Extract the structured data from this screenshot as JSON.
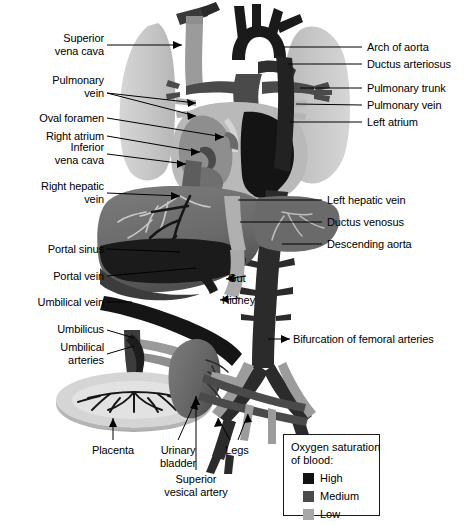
{
  "figure": {
    "type": "anatomical-diagram"
  },
  "labels_left": [
    {
      "id": "superior-vena-cava",
      "text": "Superior\nvena cava",
      "x": 18,
      "y": 32,
      "w": 86
    },
    {
      "id": "pulmonary-vein-left",
      "text": "Pulmonary\nvein",
      "x": 18,
      "y": 74,
      "w": 86
    },
    {
      "id": "oval-foramen",
      "text": "Oval foramen",
      "x": 14,
      "y": 112,
      "w": 90
    },
    {
      "id": "right-atrium",
      "text": "Right atrium",
      "x": 14,
      "y": 130,
      "w": 90
    },
    {
      "id": "inferior-vena-cava",
      "text": "Inferior\nvena cava",
      "x": 18,
      "y": 141,
      "w": 86
    },
    {
      "id": "right-hepatic-vein",
      "text": "Right hepatic\nvein",
      "x": 6,
      "y": 180,
      "w": 98
    },
    {
      "id": "portal-sinus",
      "text": "Portal sinus",
      "x": 14,
      "y": 243,
      "w": 90
    },
    {
      "id": "portal-vein",
      "text": "Portal vein",
      "x": 14,
      "y": 270,
      "w": 90
    },
    {
      "id": "umbilical-vein",
      "text": "Umbilical vein",
      "x": 6,
      "y": 296,
      "w": 98
    },
    {
      "id": "umbilicus",
      "text": "Umbilicus",
      "x": 22,
      "y": 323,
      "w": 82
    },
    {
      "id": "umbilical-arteries",
      "text": "Umbilical\narteries",
      "x": 26,
      "y": 341,
      "w": 78
    }
  ],
  "labels_right": [
    {
      "id": "arch-of-aorta",
      "text": "Arch of aorta",
      "x": 367,
      "y": 41
    },
    {
      "id": "ductus-arteriosus",
      "text": "Ductus arteriosus",
      "x": 367,
      "y": 58
    },
    {
      "id": "pulmonary-trunk",
      "text": "Pulmonary trunk",
      "x": 367,
      "y": 82
    },
    {
      "id": "pulmonary-vein-right",
      "text": "Pulmonary vein",
      "x": 367,
      "y": 99
    },
    {
      "id": "left-atrium",
      "text": "Left atrium",
      "x": 367,
      "y": 116
    },
    {
      "id": "left-hepatic-vein",
      "text": "Left hepatic vein",
      "x": 327,
      "y": 194
    },
    {
      "id": "ductus-venosus",
      "text": "Ductus venosus",
      "x": 327,
      "y": 216
    },
    {
      "id": "descending-aorta",
      "text": "Descending aorta",
      "x": 327,
      "y": 238
    },
    {
      "id": "bifurcation-femoral",
      "text": "Bifurcation of femoral arteries",
      "x": 293,
      "y": 333
    }
  ],
  "labels_inner": [
    {
      "id": "gut",
      "text": "Gut",
      "x": 228,
      "y": 272
    },
    {
      "id": "kidney",
      "text": "Kidney",
      "x": 222,
      "y": 294
    }
  ],
  "labels_bottom": [
    {
      "id": "placenta",
      "text": "Placenta",
      "x": 83,
      "y": 444,
      "w": 60
    },
    {
      "id": "urinary-bladder",
      "text": "Urinary\nbladder",
      "x": 150,
      "y": 444,
      "w": 56
    },
    {
      "id": "legs",
      "text": "Legs",
      "x": 220,
      "y": 444,
      "w": 34
    },
    {
      "id": "superior-vesical-artery",
      "text": "Superior\nvesical artery",
      "x": 149,
      "y": 473,
      "w": 94
    }
  ],
  "legend": {
    "title": "Oxygen saturation\nof blood:",
    "items": [
      {
        "label": "High",
        "color": "#111111"
      },
      {
        "label": "Medium",
        "color": "#4a4a4a"
      },
      {
        "label": "Low",
        "color": "#a8a8a8"
      }
    ]
  },
  "colors": {
    "high": "#111111",
    "medium": "#4a4a4a",
    "low": "#a8a8a8",
    "lung": "#c9c9c9",
    "liver": "#6e6e6e",
    "placenta": "#c4c4c4",
    "bladder": "#6e6e6e",
    "leader": "#000000",
    "background": "#ffffff"
  }
}
